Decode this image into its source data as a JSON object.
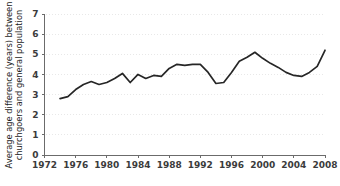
{
  "chart_data": {
    "type": "line",
    "title": "",
    "subtitle": "",
    "xlabel": "",
    "ylabel_line1": "Average age difference (years) between",
    "ylabel_line2": "churchgoers and general population",
    "xlim": [
      1972,
      2008
    ],
    "ylim": [
      0,
      7
    ],
    "grid": true,
    "grid_axis": "y",
    "legend": "none",
    "xticks": [
      1972,
      1976,
      1980,
      1984,
      1988,
      1992,
      1996,
      2000,
      2004,
      2008
    ],
    "yticks": [
      0,
      1,
      2,
      3,
      4,
      5,
      6,
      7
    ],
    "series": [
      {
        "name": "Average age difference",
        "color": "#262626",
        "x": [
          1974,
          1975,
          1976,
          1977,
          1978,
          1979,
          1980,
          1981,
          1982,
          1983,
          1984,
          1985,
          1986,
          1987,
          1988,
          1989,
          1990,
          1991,
          1992,
          1993,
          1994,
          1995,
          1996,
          1997,
          1998,
          1999,
          2000,
          2001,
          2002,
          2003,
          2004,
          2005,
          2006,
          2007,
          2008
        ],
        "values": [
          2.8,
          2.9,
          3.25,
          3.5,
          3.65,
          3.5,
          3.6,
          3.8,
          4.05,
          3.6,
          4.0,
          3.8,
          3.95,
          3.9,
          4.3,
          4.5,
          4.45,
          4.5,
          4.5,
          4.1,
          3.55,
          3.6,
          4.1,
          4.65,
          4.85,
          5.1,
          4.8,
          4.55,
          4.35,
          4.1,
          3.95,
          3.9,
          4.1,
          4.4,
          5.2
        ]
      }
    ]
  },
  "axis": {
    "y_tick_labels": [
      "0",
      "1",
      "2",
      "3",
      "4",
      "5",
      "6",
      "7"
    ],
    "x_tick_labels": [
      "1972",
      "1976",
      "1980",
      "1984",
      "1988",
      "1992",
      "1996",
      "2000",
      "2004",
      "2008"
    ]
  },
  "colors": {
    "line": "#262626",
    "axis": "#6b6b6b",
    "grid": "#dedede",
    "text": "#1c1c1c",
    "background": "#ffffff"
  }
}
